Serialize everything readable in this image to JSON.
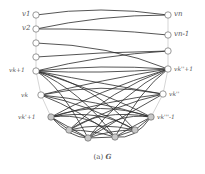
{
  "figure": {
    "caption_prefix": "(a)",
    "caption_symbol": "G",
    "edge_color": "#2a2a2a",
    "path_color": "#b0b0b0",
    "node_fill_white": "#ffffff",
    "node_fill_gray": "#c8c8c8",
    "node_stroke": "#555555"
  },
  "labels": {
    "v1": "v1",
    "v2": "v2",
    "vk1": "vk+1",
    "vk": "vk",
    "vkm1": "vk'+1",
    "vn": "vn",
    "vn1": "vn-1",
    "vright_plus": "vk''+1",
    "vright": "vk''",
    "vright_minus": "vk'''-1"
  },
  "nodes": {
    "left": [
      {
        "id": "v1",
        "x": 36,
        "y": 15,
        "fill": "white"
      },
      {
        "id": "v2",
        "x": 36,
        "y": 29,
        "fill": "white"
      },
      {
        "id": "l3",
        "x": 36,
        "y": 43,
        "fill": "white"
      },
      {
        "id": "l4",
        "x": 36,
        "y": 57,
        "fill": "white"
      },
      {
        "id": "vk1",
        "x": 36,
        "y": 71,
        "fill": "white"
      },
      {
        "id": "vk",
        "x": 41,
        "y": 95,
        "fill": "white"
      }
    ],
    "right": [
      {
        "id": "vn",
        "x": 168,
        "y": 15,
        "fill": "white"
      },
      {
        "id": "vn1",
        "x": 168,
        "y": 35,
        "fill": "white"
      },
      {
        "id": "r3",
        "x": 168,
        "y": 51,
        "fill": "white"
      },
      {
        "id": "vright_plus",
        "x": 168,
        "y": 69,
        "fill": "white"
      },
      {
        "id": "vright",
        "x": 163,
        "y": 94,
        "fill": "white"
      }
    ],
    "bottom": [
      {
        "id": "vkm1",
        "x": 51,
        "y": 117,
        "fill": "gray"
      },
      {
        "id": "b2",
        "x": 69,
        "y": 130,
        "fill": "gray"
      },
      {
        "id": "b3",
        "x": 88,
        "y": 138,
        "fill": "gray"
      },
      {
        "id": "b4",
        "x": 115,
        "y": 137,
        "fill": "gray"
      },
      {
        "id": "b5",
        "x": 135,
        "y": 130,
        "fill": "gray"
      },
      {
        "id": "vright_minus",
        "x": 151,
        "y": 117,
        "fill": "gray"
      }
    ]
  }
}
